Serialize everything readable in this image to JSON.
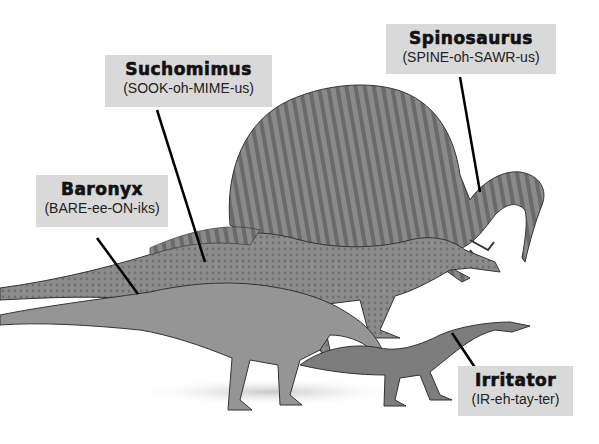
{
  "labels": {
    "spinosaurus": {
      "name": "Spinosaurus",
      "pronunciation": "(SPINE-oh-SAWR-us)"
    },
    "suchomimus": {
      "name": "Suchomimus",
      "pronunciation": "(SOOK-oh-MIME-us)"
    },
    "baronyx": {
      "name": "Baronyx",
      "pronunciation": "(BARE-ee-ON-iks)"
    },
    "irritator": {
      "name": "Irritator",
      "pronunciation": "(IR-eh-tay-ter)"
    }
  },
  "colors": {
    "label_bg": "#d9d9d9",
    "text": "#111111",
    "leader": "#000000"
  }
}
